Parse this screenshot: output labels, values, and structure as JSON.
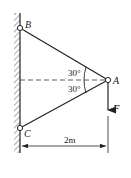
{
  "diagram": {
    "type": "statics-truss",
    "points": {
      "B": {
        "label": "B",
        "x": 20,
        "y": 28
      },
      "C": {
        "label": "C",
        "x": 20,
        "y": 128
      },
      "A": {
        "label": "A",
        "x": 108,
        "y": 80
      }
    },
    "angles": [
      {
        "label": "30°",
        "position": "upper"
      },
      {
        "label": "30°",
        "position": "lower"
      }
    ],
    "force": {
      "label": "F",
      "direction": "down"
    },
    "dimension": {
      "label": "2m"
    },
    "colors": {
      "line": "#222222",
      "background": "#ffffff"
    }
  }
}
